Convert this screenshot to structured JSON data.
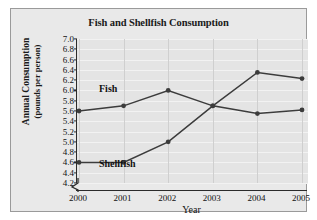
{
  "chart_data": {
    "type": "line",
    "title": "Fish and Shellfish Consumption",
    "xlabel": "Year",
    "ylabel_line1": "Annual Consumption",
    "ylabel_line2": "(pounds per person)",
    "categories": [
      "2000",
      "2001",
      "2002",
      "2003",
      "2004",
      "2005"
    ],
    "x": [
      2000,
      2001,
      2002,
      2003,
      2004,
      2005
    ],
    "series": [
      {
        "name": "Fish",
        "values": [
          5.6,
          5.7,
          6.0,
          5.7,
          5.55,
          5.62
        ],
        "color": "#3c3c3c",
        "inline_label": "Fish"
      },
      {
        "name": "Shellfish",
        "values": [
          4.6,
          4.6,
          5.0,
          5.7,
          6.35,
          6.23
        ],
        "color": "#3c3c3c",
        "inline_label": "Shellfish"
      }
    ],
    "ylim": [
      4.2,
      7.0
    ],
    "ytick_step": 0.2,
    "yticks": [
      "7.0",
      "6.8",
      "6.6",
      "6.4",
      "6.2",
      "6.0",
      "5.8",
      "5.6",
      "5.4",
      "5.2",
      "5.0",
      "4.8",
      "4.6",
      "4.4",
      "4.2"
    ],
    "xticks": [
      "2000",
      "2001",
      "2002",
      "2003",
      "2004",
      "2005"
    ],
    "grid": true,
    "grid_orientation": "both",
    "legend": "inline-labels",
    "axis_break": true,
    "marker": "circle",
    "plot_background": "#e4e4e4",
    "panel_background": "#e9e9e9",
    "axis_color": "#2b2b2b"
  }
}
